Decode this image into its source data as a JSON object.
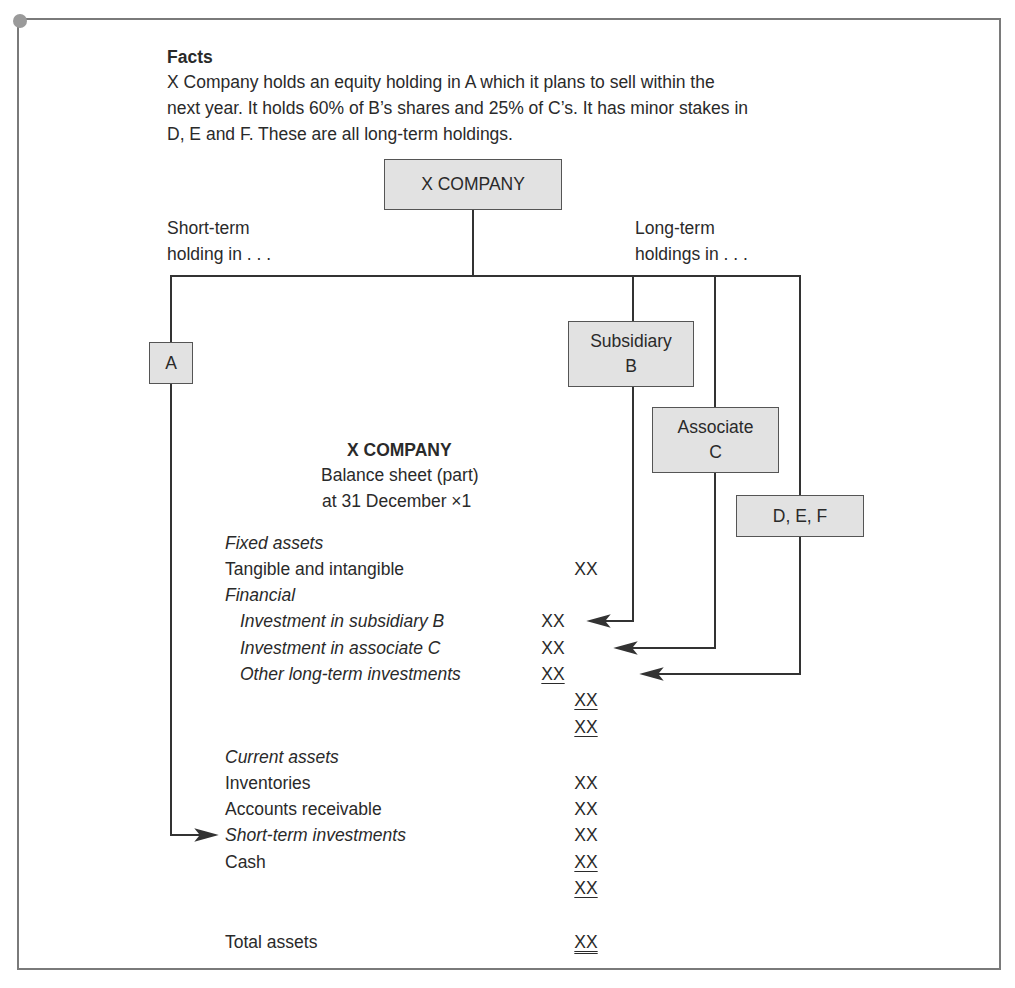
{
  "facts": {
    "title": "Facts",
    "lines": [
      "X Company holds an equity holding in A which it plans to sell within the",
      "next year. It holds 60% of B’s shares and 25% of C’s. It has minor stakes in",
      "D, E and F. These are all long-term holdings."
    ]
  },
  "diagram": {
    "root": "X COMPANY",
    "short_term_label": [
      "Short-term",
      "holding in . . ."
    ],
    "long_term_label": [
      "Long-term",
      "holdings in . . ."
    ],
    "nodes": {
      "a": [
        "A"
      ],
      "b": [
        "Subsidiary",
        "B"
      ],
      "c": [
        "Associate",
        "C"
      ],
      "def": [
        "D, E, F"
      ]
    }
  },
  "balance_sheet": {
    "title": "X COMPANY",
    "subtitle": "Balance sheet (part)",
    "date": "at 31 December ×1",
    "fixed_assets": {
      "heading": "Fixed assets",
      "tangible": {
        "label": "Tangible and intangible",
        "value": "XX"
      },
      "financial_heading": "Financial",
      "subsidiary": {
        "label": "Investment in subsidiary B",
        "value": "XX"
      },
      "associate": {
        "label": "Investment in associate C",
        "value": "XX"
      },
      "other": {
        "label": "Other long-term investments",
        "value": "XX"
      },
      "financial_total": "XX",
      "fixed_total": "XX"
    },
    "current_assets": {
      "heading": "Current assets",
      "inventories": {
        "label": "Inventories",
        "value": "XX"
      },
      "receivable": {
        "label": "Accounts receivable",
        "value": "XX"
      },
      "short_term": {
        "label": "Short-term investments",
        "value": "XX"
      },
      "cash": {
        "label": "Cash",
        "value": "XX"
      },
      "current_total": "XX"
    },
    "total_assets": {
      "label": "Total assets",
      "value": "XX"
    }
  }
}
